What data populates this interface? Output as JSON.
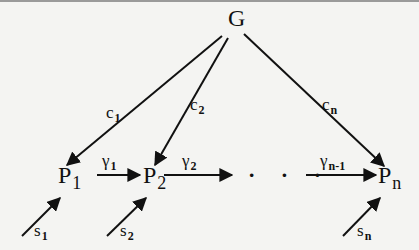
{
  "diagram": {
    "root": {
      "label": "G"
    },
    "nodes": [
      {
        "id": "p1",
        "label": "P",
        "sub": "1"
      },
      {
        "id": "p2",
        "label": "P",
        "sub": "2"
      },
      {
        "id": "pn",
        "label": "P",
        "sub": "n"
      }
    ],
    "ellipsis": "· · ·",
    "edges_from_root": [
      {
        "to": "p1",
        "label": "c",
        "sub": "1"
      },
      {
        "to": "p2",
        "label": "c",
        "sub": "2"
      },
      {
        "to": "pn",
        "label": "c",
        "sub": "n"
      }
    ],
    "chain_edges": [
      {
        "from": "p1",
        "to": "p2",
        "label": "γ",
        "sub": "1"
      },
      {
        "from": "p2",
        "to": "…",
        "label": "γ",
        "sub": "2"
      },
      {
        "from": "…",
        "to": "pn",
        "label": "γ",
        "sub": "n-1"
      }
    ],
    "input_edges": [
      {
        "to": "p1",
        "label": "s",
        "sub": "1"
      },
      {
        "to": "p2",
        "label": "s",
        "sub": "2"
      },
      {
        "to": "pn",
        "label": "s",
        "sub": "n"
      }
    ]
  }
}
